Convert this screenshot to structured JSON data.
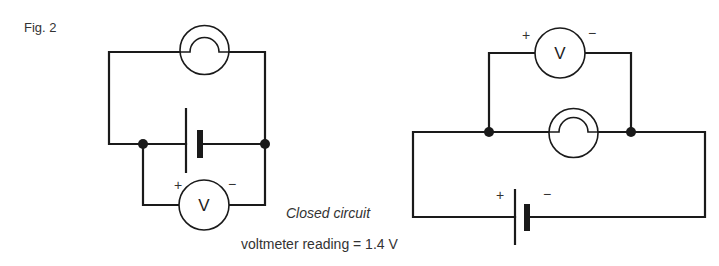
{
  "figure": {
    "label": "Fig. 2",
    "caption": "Closed circuit",
    "reading": "voltmeter reading  =  1.4 V"
  },
  "left_circuit": {
    "description": "Battery with voltmeter connected directly across it; lamp in the outer loop",
    "components": [
      "lamp",
      "battery",
      "voltmeter"
    ],
    "voltmeter_symbol": "V",
    "voltmeter_plus": "+",
    "voltmeter_minus": "−"
  },
  "right_circuit": {
    "description": "Voltmeter connected across the lamp; battery in the outer loop",
    "components": [
      "voltmeter",
      "lamp",
      "battery"
    ],
    "voltmeter_symbol": "V",
    "voltmeter_plus": "+",
    "voltmeter_minus": "−",
    "battery_plus": "+",
    "battery_minus": "−"
  },
  "colors": {
    "line": "#1a1a1a",
    "background": "#ffffff"
  }
}
